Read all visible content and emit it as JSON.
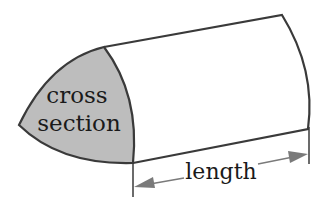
{
  "diagram": {
    "labels": {
      "cross_line1": "cross",
      "cross_line2": "section",
      "length": "length"
    },
    "colors": {
      "outline": "#3a3a3a",
      "cross_fill": "#bdbdbd",
      "arrow": "#7a7a7a",
      "background": "#ffffff"
    }
  }
}
